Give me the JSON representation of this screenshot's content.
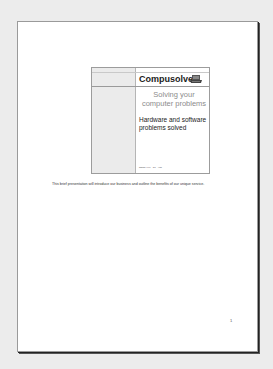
{
  "document": {
    "page_number": "1",
    "slide": {
      "title": "Compusolve",
      "subtitle": "Solving your computer problems",
      "body": "Hardware and software problems solved",
      "footer": "Name Xxx · 10 · #00",
      "logo_icon": "computer-icon"
    },
    "notes": "This brief presentation will introduce our business and outline the benefits of our unique service."
  }
}
